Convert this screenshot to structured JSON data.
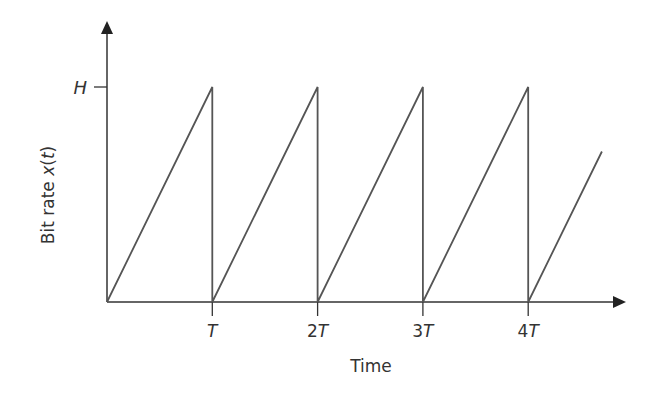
{
  "chart_data": {
    "type": "line",
    "title": "",
    "xlabel": "Time",
    "ylabel_prefix": "Bit rate ",
    "ylabel_var": "x",
    "ylabel_paren_open": "(",
    "ylabel_arg": "t",
    "ylabel_paren_close": ")",
    "ylabel": "Bit rate x(t)",
    "x_ticks": [
      {
        "coef": "",
        "sym": "T",
        "value": 1
      },
      {
        "coef": "2",
        "sym": "T",
        "value": 2
      },
      {
        "coef": "3",
        "sym": "T",
        "value": 3
      },
      {
        "coef": "4",
        "sym": "T",
        "value": 4
      }
    ],
    "y_ticks": [
      {
        "label": "H",
        "value": 1
      }
    ],
    "series": [
      {
        "name": "x(t) sawtooth",
        "x": [
          0,
          1,
          1,
          2,
          2,
          3,
          3,
          4,
          4,
          4.7
        ],
        "y": [
          0,
          1,
          0,
          1,
          0,
          1,
          0,
          1,
          0,
          0.7
        ]
      }
    ],
    "xlim": [
      0,
      4.9
    ],
    "ylim": [
      0,
      1.4
    ],
    "grid": false,
    "legend": "none",
    "line_color": "#555555",
    "axis_color": "#333333"
  }
}
